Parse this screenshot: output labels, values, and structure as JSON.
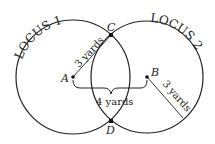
{
  "diagram": {
    "locus1_label": "LOCUS 1",
    "locus2_label": "LOCUS 2",
    "points": {
      "A": "A",
      "B": "B",
      "C": "C",
      "D": "D"
    },
    "radius_label_1": "3 yards",
    "radius_label_2": "3 yards",
    "distance_label": "4 yards",
    "stroke_color": "#222222"
  }
}
